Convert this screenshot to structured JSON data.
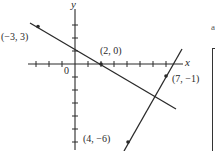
{
  "figure": {
    "axes": {
      "x_label": "x",
      "y_label": "y",
      "origin_label": "0"
    },
    "points": [
      {
        "label": "(−3, 3)",
        "x": -3,
        "y": 3
      },
      {
        "label": "(2, 0)",
        "x": 2,
        "y": 0
      },
      {
        "label": "(7, −1)",
        "x": 7,
        "y": -1
      },
      {
        "label": "(4, −6)",
        "x": 4,
        "y": -6
      }
    ],
    "lines": [
      {
        "name": "line-through-(-3,3)-(2,0)",
        "through": [
          [
            -3,
            3
          ],
          [
            2,
            0
          ]
        ]
      },
      {
        "name": "line-through-(4,-6)-(7,-1)",
        "through": [
          [
            4,
            -6
          ],
          [
            7,
            -1
          ]
        ]
      }
    ],
    "margin_mark": "a",
    "colors": {
      "ink": "#2a2a2a",
      "background": "#ffffff"
    }
  }
}
